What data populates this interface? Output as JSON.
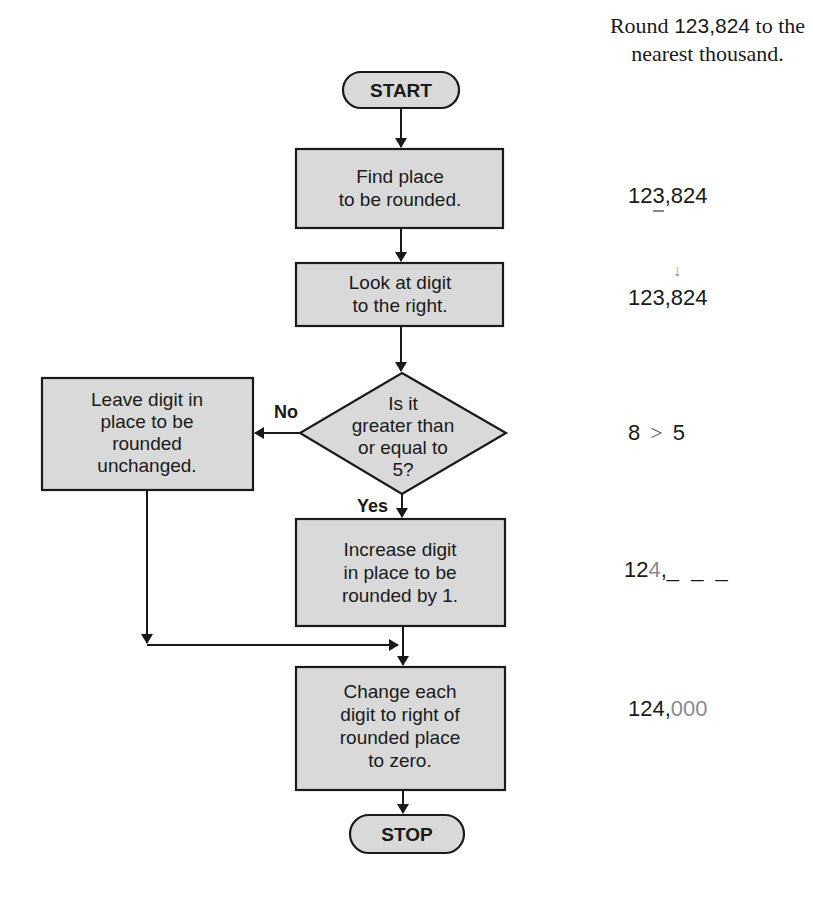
{
  "problem": {
    "prefix": "Round ",
    "number": "123,824",
    "suffix_line1": " to the",
    "line2": "nearest thousand."
  },
  "flowchart": {
    "start": "START",
    "stop": "STOP",
    "step1": {
      "lines": [
        "Find place",
        "to be rounded."
      ]
    },
    "step2": {
      "lines": [
        "Look at digit",
        "to the right."
      ]
    },
    "decision": {
      "lines": [
        "Is it",
        "greater than",
        "or equal to",
        "5?"
      ]
    },
    "no_branch": {
      "label": "No",
      "lines": [
        "Leave digit in",
        "place to be",
        "rounded",
        "unchanged."
      ]
    },
    "yes_label": "Yes",
    "step3": {
      "lines": [
        "Increase digit",
        "in place to be",
        "rounded by 1."
      ]
    },
    "step4": {
      "lines": [
        "Change each",
        "digit to right of",
        "rounded place",
        "to zero."
      ]
    }
  },
  "worked_example": {
    "step1": {
      "before": "12",
      "highlight": "3",
      "after": ",824"
    },
    "step2": {
      "before": "123,",
      "highlight": "8",
      "after": "24",
      "arrow": "↓"
    },
    "step3": {
      "left": "8",
      "operator": ">",
      "right": "5"
    },
    "step4": {
      "before": "12",
      "highlight": "4",
      "after": ",",
      "blanks": "_ _ _"
    },
    "step5": {
      "before": "124,",
      "zeros": "000"
    }
  },
  "colors": {
    "box_fill": "#d9d9d9",
    "stroke": "#1a1a1a",
    "highlight_gray": "#8a8a8a"
  }
}
